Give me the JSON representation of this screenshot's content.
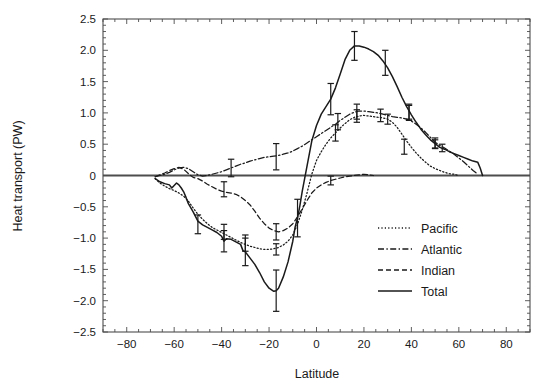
{
  "chart_data": {
    "type": "line",
    "title": "",
    "xlabel": "Latitude",
    "ylabel": "Heat transport (PW)",
    "xlim": [
      -90,
      90
    ],
    "ylim": [
      -2.5,
      2.5
    ],
    "xticks": [
      -80,
      -60,
      -40,
      -20,
      0,
      20,
      40,
      60,
      80
    ],
    "xticklabels": [
      "−80",
      "−60",
      "−40",
      "−20",
      "0",
      "20",
      "40",
      "60",
      "80"
    ],
    "yticks": [
      -2.5,
      -2.0,
      -1.5,
      -1.0,
      -0.5,
      0,
      0.5,
      1.0,
      1.5,
      2.0,
      2.5
    ],
    "yticklabels": [
      "−2.5",
      "−2.0",
      "−1.5",
      "−1.0",
      "−0.5",
      "0",
      "0.5",
      "1.0",
      "1.5",
      "2.0",
      "2.5"
    ],
    "grid": false,
    "zero_line": 0,
    "legend_position": "lower right",
    "legend": [
      "Pacific",
      "Atlantic",
      "Indian",
      "Total"
    ],
    "series": [
      {
        "name": "Pacific",
        "style": "dotted",
        "color": "#1a1a1a",
        "x": [
          -68,
          -66,
          -64,
          -62,
          -60,
          -58,
          -56,
          -54,
          -52,
          -50,
          -48,
          -46,
          -44,
          -42,
          -40,
          -38,
          -36,
          -34,
          -32,
          -30,
          -28,
          -26,
          -24,
          -22,
          -20,
          -18,
          -16,
          -14,
          -12,
          -10,
          -8,
          -6,
          -4,
          -2,
          0,
          2,
          4,
          6,
          8,
          10,
          12,
          14,
          16,
          18,
          20,
          22,
          24,
          26,
          28,
          30,
          32,
          34,
          36,
          38,
          40,
          42,
          44,
          46,
          48,
          50,
          52,
          54,
          56,
          58,
          60
        ],
        "y": [
          -0.05,
          -0.12,
          -0.17,
          -0.21,
          -0.24,
          -0.28,
          -0.33,
          -0.41,
          -0.52,
          -0.62,
          -0.7,
          -0.77,
          -0.83,
          -0.87,
          -0.91,
          -0.95,
          -0.99,
          -1.03,
          -1.07,
          -1.1,
          -1.13,
          -1.15,
          -1.17,
          -1.18,
          -1.18,
          -1.17,
          -1.15,
          -1.11,
          -1.05,
          -0.95,
          -0.78,
          -0.55,
          -0.28,
          0.02,
          0.24,
          0.38,
          0.5,
          0.6,
          0.68,
          0.76,
          0.83,
          0.89,
          0.93,
          0.95,
          0.96,
          0.95,
          0.94,
          0.93,
          0.92,
          0.9,
          0.85,
          0.77,
          0.66,
          0.55,
          0.45,
          0.36,
          0.28,
          0.21,
          0.15,
          0.11,
          0.08,
          0.05,
          0.03,
          0.02,
          0.0
        ]
      },
      {
        "name": "Atlantic",
        "style": "dashdot",
        "color": "#1a1a1a",
        "x": [
          -68,
          -66,
          -64,
          -62,
          -60,
          -58,
          -56,
          -54,
          -52,
          -50,
          -48,
          -46,
          -44,
          -42,
          -40,
          -38,
          -36,
          -34,
          -32,
          -30,
          -28,
          -26,
          -24,
          -22,
          -20,
          -18,
          -16,
          -14,
          -12,
          -10,
          -8,
          -6,
          -4,
          -2,
          0,
          2,
          4,
          6,
          8,
          10,
          12,
          14,
          16,
          18,
          20,
          22,
          24,
          26,
          28,
          30,
          32,
          34,
          36,
          38,
          40,
          42,
          44,
          46,
          48,
          50,
          52,
          54,
          56,
          58,
          60,
          62,
          64,
          66,
          68
        ],
        "y": [
          -0.02,
          0.0,
          0.02,
          0.05,
          0.09,
          0.12,
          0.13,
          0.11,
          0.06,
          0.01,
          -0.01,
          0.0,
          0.02,
          0.04,
          0.06,
          0.09,
          0.12,
          0.15,
          0.18,
          0.2,
          0.23,
          0.25,
          0.27,
          0.29,
          0.3,
          0.31,
          0.32,
          0.34,
          0.36,
          0.39,
          0.43,
          0.47,
          0.52,
          0.57,
          0.62,
          0.67,
          0.72,
          0.77,
          0.82,
          0.88,
          0.93,
          0.98,
          1.01,
          1.03,
          1.03,
          1.02,
          1.01,
          1.0,
          0.98,
          0.96,
          0.94,
          0.93,
          0.92,
          0.9,
          0.87,
          0.82,
          0.76,
          0.69,
          0.61,
          0.53,
          0.48,
          0.44,
          0.39,
          0.34,
          0.28,
          0.22,
          0.15,
          0.08,
          0.02
        ]
      },
      {
        "name": "Indian",
        "style": "dashed",
        "color": "#1a1a1a",
        "x": [
          -68,
          -66,
          -64,
          -62,
          -60,
          -58,
          -56,
          -54,
          -52,
          -50,
          -48,
          -46,
          -44,
          -42,
          -40,
          -38,
          -36,
          -34,
          -32,
          -30,
          -28,
          -26,
          -24,
          -22,
          -20,
          -18,
          -16,
          -14,
          -12,
          -10,
          -8,
          -6,
          -4,
          -2,
          0,
          2,
          4,
          6,
          8,
          10,
          12,
          14,
          16,
          18,
          20,
          22,
          24
        ],
        "y": [
          -0.02,
          0.01,
          0.04,
          0.08,
          0.11,
          0.13,
          0.1,
          0.03,
          -0.03,
          -0.05,
          -0.09,
          -0.14,
          -0.18,
          -0.22,
          -0.25,
          -0.27,
          -0.28,
          -0.3,
          -0.34,
          -0.4,
          -0.47,
          -0.57,
          -0.68,
          -0.77,
          -0.84,
          -0.88,
          -0.9,
          -0.88,
          -0.84,
          -0.77,
          -0.66,
          -0.53,
          -0.4,
          -0.28,
          -0.2,
          -0.15,
          -0.11,
          -0.08,
          -0.06,
          -0.04,
          -0.02,
          -0.01,
          0.0,
          0.01,
          0.02,
          0.01,
          0.0
        ]
      },
      {
        "name": "Total",
        "style": "solid",
        "color": "#1a1a1a",
        "x": [
          -68,
          -66,
          -64,
          -62,
          -61,
          -60,
          -59,
          -58,
          -57,
          -56,
          -55,
          -54,
          -52,
          -50,
          -48,
          -46,
          -44,
          -42,
          -40,
          -39,
          -38,
          -36,
          -34,
          -32,
          -31,
          -30,
          -28,
          -26,
          -24,
          -22,
          -20,
          -18,
          -17,
          -16,
          -14,
          -12,
          -10,
          -9,
          -8,
          -7,
          -6,
          -4,
          -2,
          0,
          2,
          4,
          6,
          8,
          10,
          12,
          14,
          16,
          18,
          20,
          22,
          24,
          26,
          28,
          30,
          32,
          34,
          36,
          38,
          40,
          42,
          44,
          46,
          48,
          50,
          52,
          54,
          56,
          58,
          60,
          62,
          64,
          66,
          68,
          69,
          70
        ],
        "y": [
          -0.05,
          -0.1,
          -0.13,
          -0.15,
          -0.2,
          -0.16,
          -0.12,
          -0.15,
          -0.2,
          -0.26,
          -0.35,
          -0.45,
          -0.58,
          -0.73,
          -0.79,
          -0.83,
          -0.87,
          -0.91,
          -0.97,
          -1.05,
          -1.01,
          -1.02,
          -1.06,
          -1.1,
          -1.2,
          -1.22,
          -1.32,
          -1.42,
          -1.55,
          -1.7,
          -1.8,
          -1.85,
          -1.84,
          -1.8,
          -1.62,
          -1.38,
          -1.05,
          -0.82,
          -0.68,
          -0.48,
          -0.25,
          0.15,
          0.55,
          0.8,
          0.98,
          1.1,
          1.22,
          1.4,
          1.62,
          1.85,
          2.0,
          2.07,
          2.07,
          2.05,
          2.02,
          1.98,
          1.92,
          1.83,
          1.72,
          1.58,
          1.42,
          1.25,
          1.1,
          0.97,
          0.85,
          0.74,
          0.65,
          0.57,
          0.51,
          0.45,
          0.42,
          0.38,
          0.35,
          0.32,
          0.29,
          0.26,
          0.23,
          0.21,
          0.12,
          0.0
        ]
      }
    ],
    "error_bars": [
      {
        "series": "Total",
        "x": -50,
        "y": -0.78,
        "err": 0.15
      },
      {
        "series": "Total",
        "x": -39,
        "y": -1.05,
        "err": 0.17
      },
      {
        "series": "Total",
        "x": -30,
        "y": -1.22,
        "err": 0.22
      },
      {
        "series": "Total",
        "x": -17,
        "y": -1.84,
        "err": 0.33
      },
      {
        "series": "Total",
        "x": -8,
        "y": -0.68,
        "err": 0.3
      },
      {
        "series": "Total",
        "x": 6,
        "y": 1.22,
        "err": 0.25
      },
      {
        "series": "Total",
        "x": 16,
        "y": 2.07,
        "err": 0.23
      },
      {
        "series": "Total",
        "x": 29,
        "y": 1.8,
        "err": 0.2
      },
      {
        "series": "Total",
        "x": 39,
        "y": 1.02,
        "err": 0.12
      },
      {
        "series": "Total",
        "x": 50,
        "y": 0.52,
        "err": 0.08
      },
      {
        "series": "Pacific",
        "x": -39,
        "y": -0.9,
        "err": 0.12
      },
      {
        "series": "Pacific",
        "x": -30,
        "y": -1.08,
        "err": 0.13
      },
      {
        "series": "Pacific",
        "x": -17,
        "y": -1.18,
        "err": 0.09
      },
      {
        "series": "Pacific",
        "x": 8,
        "y": 0.68,
        "err": 0.13
      },
      {
        "series": "Pacific",
        "x": 17,
        "y": 0.95,
        "err": 0.1
      },
      {
        "series": "Pacific",
        "x": 30,
        "y": 0.9,
        "err": 0.08
      },
      {
        "series": "Pacific",
        "x": 37,
        "y": 0.46,
        "err": 0.12
      },
      {
        "series": "Atlantic",
        "x": -36,
        "y": 0.12,
        "err": 0.14
      },
      {
        "series": "Atlantic",
        "x": -17,
        "y": 0.3,
        "err": 0.21
      },
      {
        "series": "Atlantic",
        "x": 9,
        "y": 0.86,
        "err": 0.13
      },
      {
        "series": "Atlantic",
        "x": 17,
        "y": 1.02,
        "err": 0.12
      },
      {
        "series": "Atlantic",
        "x": 27,
        "y": 0.96,
        "err": 0.1
      },
      {
        "series": "Atlantic",
        "x": 39,
        "y": 1.0,
        "err": 0.12
      },
      {
        "series": "Atlantic",
        "x": 50,
        "y": 0.5,
        "err": 0.07
      },
      {
        "series": "Atlantic",
        "x": 53,
        "y": 0.44,
        "err": 0.06
      },
      {
        "series": "Indian",
        "x": -39,
        "y": -0.22,
        "err": 0.12
      },
      {
        "series": "Indian",
        "x": -17,
        "y": -0.9,
        "err": 0.13
      },
      {
        "series": "Indian",
        "x": 6,
        "y": -0.08,
        "err": 0.07
      }
    ]
  },
  "axes": {
    "xlabel": "Latitude",
    "ylabel": "Heat transport (PW)"
  },
  "legend": {
    "items": [
      {
        "label": "Pacific",
        "style": "dotted"
      },
      {
        "label": "Atlantic",
        "style": "dashdot"
      },
      {
        "label": "Indian",
        "style": "dashed"
      },
      {
        "label": "Total",
        "style": "solid"
      }
    ]
  },
  "colors": {
    "ink": "#1a1a1a",
    "axis": "#4d4d4d",
    "background": "#ffffff"
  }
}
